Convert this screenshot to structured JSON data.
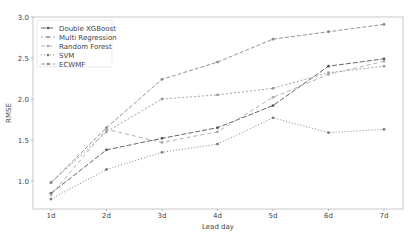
{
  "chart_data": {
    "type": "line",
    "title": "",
    "xlabel": "Lead day",
    "ylabel": "RMSE",
    "categories": [
      "1d",
      "2d",
      "3d",
      "4d",
      "5d",
      "6d",
      "7d"
    ],
    "ylim": [
      0.66,
      3.0
    ],
    "yticks": [
      "1.0",
      "1.5",
      "2.0",
      "2.5",
      "3.0"
    ],
    "grid": false,
    "legend_position": "upper left",
    "series": [
      {
        "name": "Double XGBoost",
        "values": [
          0.85,
          1.38,
          1.52,
          1.65,
          1.92,
          2.4,
          2.49
        ],
        "color": "#555555",
        "dash": "5,2"
      },
      {
        "name": "Multi Regression",
        "values": [
          0.98,
          1.6,
          2.0,
          2.05,
          2.13,
          2.32,
          2.4
        ],
        "color": "#999999",
        "dash": "2,2"
      },
      {
        "name": "Random Forest",
        "values": [
          0.83,
          1.63,
          1.47,
          1.6,
          2.02,
          2.3,
          2.46
        ],
        "color": "#aaaaaa",
        "dash": "4,3"
      },
      {
        "name": "SVM",
        "values": [
          0.78,
          1.14,
          1.35,
          1.45,
          1.77,
          1.59,
          1.63
        ],
        "color": "#777777",
        "dash": "1,2"
      },
      {
        "name": "ECWMF",
        "values": [
          0.98,
          1.65,
          2.24,
          2.45,
          2.73,
          2.82,
          2.91
        ],
        "color": "#888888",
        "dash": "4,2"
      }
    ]
  }
}
